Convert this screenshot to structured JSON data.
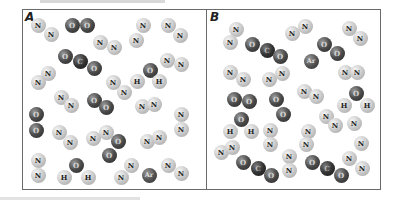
{
  "figure": {
    "panels": [
      {
        "label": "A",
        "molecules": [
          {
            "formula": "N2",
            "atoms": [
              {
                "el": "N",
                "x": 38,
                "y": 25
              },
              {
                "el": "N",
                "x": 51,
                "y": 34
              }
            ]
          },
          {
            "formula": "O2",
            "atoms": [
              {
                "el": "O",
                "x": 72,
                "y": 25
              },
              {
                "el": "O",
                "x": 87,
                "y": 25
              }
            ]
          },
          {
            "formula": "N2",
            "atoms": [
              {
                "el": "N",
                "x": 100,
                "y": 42
              },
              {
                "el": "N",
                "x": 114,
                "y": 47
              }
            ]
          },
          {
            "formula": "N2",
            "atoms": [
              {
                "el": "N",
                "x": 143,
                "y": 25
              },
              {
                "el": "N",
                "x": 136,
                "y": 40
              }
            ]
          },
          {
            "formula": "N2",
            "atoms": [
              {
                "el": "N",
                "x": 168,
                "y": 25
              },
              {
                "el": "N",
                "x": 180,
                "y": 35
              }
            ]
          },
          {
            "formula": "CO2",
            "atoms": [
              {
                "el": "O",
                "x": 65,
                "y": 56
              },
              {
                "el": "C",
                "x": 80,
                "y": 61
              },
              {
                "el": "O",
                "x": 94,
                "y": 68
              }
            ]
          },
          {
            "formula": "N2",
            "atoms": [
              {
                "el": "N",
                "x": 38,
                "y": 82
              },
              {
                "el": "N",
                "x": 48,
                "y": 73
              }
            ]
          },
          {
            "formula": "H2O",
            "atoms": [
              {
                "el": "O",
                "x": 150,
                "y": 70
              },
              {
                "el": "H",
                "x": 137,
                "y": 81
              },
              {
                "el": "H",
                "x": 159,
                "y": 81
              }
            ]
          },
          {
            "formula": "N2",
            "atoms": [
              {
                "el": "N",
                "x": 167,
                "y": 60
              },
              {
                "el": "N",
                "x": 181,
                "y": 64
              }
            ]
          },
          {
            "formula": "N2",
            "atoms": [
              {
                "el": "N",
                "x": 113,
                "y": 82
              },
              {
                "el": "N",
                "x": 124,
                "y": 92
              }
            ]
          },
          {
            "formula": "N2",
            "atoms": [
              {
                "el": "N",
                "x": 61,
                "y": 97
              },
              {
                "el": "N",
                "x": 71,
                "y": 105
              }
            ]
          },
          {
            "formula": "O2",
            "atoms": [
              {
                "el": "O",
                "x": 94,
                "y": 100
              },
              {
                "el": "O",
                "x": 106,
                "y": 107
              }
            ]
          },
          {
            "formula": "N2",
            "atoms": [
              {
                "el": "N",
                "x": 142,
                "y": 106
              },
              {
                "el": "N",
                "x": 154,
                "y": 104
              }
            ]
          },
          {
            "formula": "N2",
            "atoms": [
              {
                "el": "N",
                "x": 181,
                "y": 114
              },
              {
                "el": "N",
                "x": 181,
                "y": 129
              }
            ]
          },
          {
            "formula": "O2",
            "atoms": [
              {
                "el": "O",
                "x": 36,
                "y": 114
              },
              {
                "el": "O",
                "x": 36,
                "y": 130
              }
            ]
          },
          {
            "formula": "N2",
            "atoms": [
              {
                "el": "N",
                "x": 59,
                "y": 132
              },
              {
                "el": "N",
                "x": 70,
                "y": 142
              }
            ]
          },
          {
            "formula": "N2",
            "atoms": [
              {
                "el": "N",
                "x": 93,
                "y": 138
              },
              {
                "el": "N",
                "x": 106,
                "y": 132
              }
            ]
          },
          {
            "formula": "N2",
            "atoms": [
              {
                "el": "N",
                "x": 147,
                "y": 141
              },
              {
                "el": "N",
                "x": 159,
                "y": 137
              }
            ]
          },
          {
            "formula": "O2",
            "atoms": [
              {
                "el": "O",
                "x": 118,
                "y": 141
              },
              {
                "el": "O",
                "x": 109,
                "y": 155
              }
            ]
          },
          {
            "formula": "N2",
            "atoms": [
              {
                "el": "N",
                "x": 38,
                "y": 160
              },
              {
                "el": "N",
                "x": 38,
                "y": 175
              }
            ]
          },
          {
            "formula": "H2O",
            "atoms": [
              {
                "el": "O",
                "x": 76,
                "y": 165
              },
              {
                "el": "H",
                "x": 64,
                "y": 177
              },
              {
                "el": "H",
                "x": 88,
                "y": 177
              }
            ]
          },
          {
            "formula": "N2",
            "atoms": [
              {
                "el": "N",
                "x": 121,
                "y": 177
              },
              {
                "el": "N",
                "x": 131,
                "y": 165
              }
            ]
          },
          {
            "formula": "Ar",
            "atoms": [
              {
                "el": "Ar",
                "x": 149,
                "y": 175
              }
            ]
          },
          {
            "formula": "N2",
            "atoms": [
              {
                "el": "N",
                "x": 168,
                "y": 165
              },
              {
                "el": "N",
                "x": 181,
                "y": 173
              }
            ]
          }
        ]
      },
      {
        "label": "B",
        "molecules": [
          {
            "formula": "N2",
            "atoms": [
              {
                "el": "N",
                "x": 236,
                "y": 29
              },
              {
                "el": "N",
                "x": 230,
                "y": 42
              }
            ]
          },
          {
            "formula": "CO2",
            "atoms": [
              {
                "el": "O",
                "x": 252,
                "y": 44
              },
              {
                "el": "C",
                "x": 267,
                "y": 50
              },
              {
                "el": "O",
                "x": 280,
                "y": 56
              }
            ]
          },
          {
            "formula": "N2",
            "atoms": [
              {
                "el": "N",
                "x": 292,
                "y": 33
              },
              {
                "el": "N",
                "x": 305,
                "y": 26
              }
            ]
          },
          {
            "formula": "N2",
            "atoms": [
              {
                "el": "N",
                "x": 349,
                "y": 28
              },
              {
                "el": "N",
                "x": 360,
                "y": 38
              }
            ]
          },
          {
            "formula": "O2",
            "atoms": [
              {
                "el": "O",
                "x": 324,
                "y": 44
              },
              {
                "el": "O",
                "x": 337,
                "y": 53
              }
            ]
          },
          {
            "formula": "Ar",
            "atoms": [
              {
                "el": "Ar",
                "x": 311,
                "y": 61
              }
            ]
          },
          {
            "formula": "N2",
            "atoms": [
              {
                "el": "N",
                "x": 230,
                "y": 72
              },
              {
                "el": "N",
                "x": 243,
                "y": 79
              }
            ]
          },
          {
            "formula": "N2",
            "atoms": [
              {
                "el": "N",
                "x": 269,
                "y": 79
              },
              {
                "el": "N",
                "x": 282,
                "y": 73
              }
            ]
          },
          {
            "formula": "N2",
            "atoms": [
              {
                "el": "N",
                "x": 345,
                "y": 72
              },
              {
                "el": "N",
                "x": 357,
                "y": 72
              }
            ]
          },
          {
            "formula": "N2",
            "atoms": [
              {
                "el": "N",
                "x": 304,
                "y": 91
              },
              {
                "el": "N",
                "x": 316,
                "y": 96
              }
            ]
          },
          {
            "formula": "O2",
            "atoms": [
              {
                "el": "O",
                "x": 234,
                "y": 99
              },
              {
                "el": "O",
                "x": 249,
                "y": 101
              }
            ]
          },
          {
            "formula": "O2",
            "atoms": [
              {
                "el": "O",
                "x": 276,
                "y": 99
              },
              {
                "el": "O",
                "x": 283,
                "y": 114
              }
            ]
          },
          {
            "formula": "H2O",
            "atoms": [
              {
                "el": "O",
                "x": 356,
                "y": 93
              },
              {
                "el": "H",
                "x": 344,
                "y": 105
              },
              {
                "el": "H",
                "x": 367,
                "y": 105
              }
            ]
          },
          {
            "formula": "H2O",
            "atoms": [
              {
                "el": "O",
                "x": 241,
                "y": 119
              },
              {
                "el": "H",
                "x": 230,
                "y": 131
              },
              {
                "el": "H",
                "x": 251,
                "y": 131
              }
            ]
          },
          {
            "formula": "N2",
            "atoms": [
              {
                "el": "N",
                "x": 270,
                "y": 130
              },
              {
                "el": "N",
                "x": 270,
                "y": 144
              }
            ]
          },
          {
            "formula": "N2",
            "atoms": [
              {
                "el": "N",
                "x": 326,
                "y": 116
              },
              {
                "el": "N",
                "x": 335,
                "y": 125
              }
            ]
          },
          {
            "formula": "N2",
            "atoms": [
              {
                "el": "N",
                "x": 308,
                "y": 131
              },
              {
                "el": "N",
                "x": 306,
                "y": 144
              }
            ]
          },
          {
            "formula": "N2",
            "atoms": [
              {
                "el": "N",
                "x": 354,
                "y": 123
              },
              {
                "el": "N",
                "x": 361,
                "y": 143
              }
            ]
          },
          {
            "formula": "N2",
            "atoms": [
              {
                "el": "N",
                "x": 221,
                "y": 152
              },
              {
                "el": "N",
                "x": 232,
                "y": 147
              }
            ]
          },
          {
            "formula": "N2",
            "atoms": [
              {
                "el": "N",
                "x": 289,
                "y": 156
              },
              {
                "el": "N",
                "x": 289,
                "y": 170
              }
            ]
          },
          {
            "formula": "N2",
            "atoms": [
              {
                "el": "N",
                "x": 349,
                "y": 158
              },
              {
                "el": "N",
                "x": 362,
                "y": 168
              }
            ]
          },
          {
            "formula": "CO2",
            "atoms": [
              {
                "el": "O",
                "x": 243,
                "y": 162
              },
              {
                "el": "C",
                "x": 258,
                "y": 168
              },
              {
                "el": "O",
                "x": 271,
                "y": 175
              }
            ]
          },
          {
            "formula": "CO2",
            "atoms": [
              {
                "el": "O",
                "x": 312,
                "y": 162
              },
              {
                "el": "C",
                "x": 327,
                "y": 168
              },
              {
                "el": "O",
                "x": 341,
                "y": 175
              }
            ]
          }
        ]
      }
    ]
  }
}
